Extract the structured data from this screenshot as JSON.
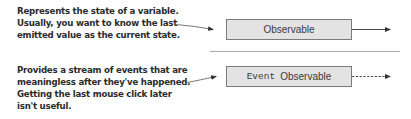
{
  "annotations": [
    {
      "lines": [
        "Represents the state of a variable.",
        "Usually, you want to know the last",
        "emitted value as the current state."
      ]
    },
    {
      "lines": [
        "Provides a stream of events that are",
        "meaningless after they've happened.",
        "Getting the last mouse click later",
        "isn't useful."
      ]
    }
  ],
  "boxes": [
    {
      "label": "Observable",
      "output_arrow": "solid"
    },
    {
      "prefix": "Event",
      "label": "Observable",
      "output_arrow": "dashed"
    }
  ],
  "colors": {
    "box_fill": "#e3e3e3",
    "box_border": "#7a7a7a",
    "text": "#2b2b2b",
    "separator": "#a8a8a8",
    "arrow": "#333333"
  }
}
